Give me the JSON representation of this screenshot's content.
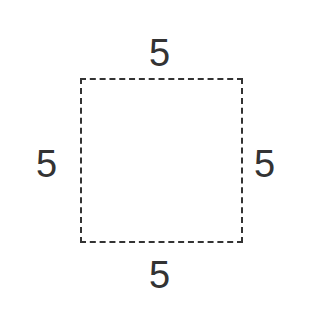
{
  "diagram": {
    "shape": "square",
    "sides": {
      "top": "5",
      "bottom": "5",
      "left": "5",
      "right": "5"
    },
    "border_style": "dashed",
    "color": "#333333"
  }
}
